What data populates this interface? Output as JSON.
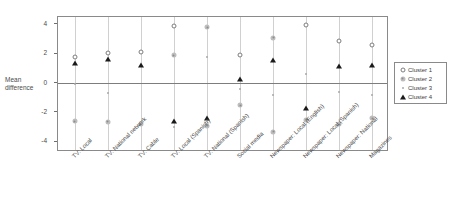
{
  "chart_data": {
    "type": "scatter",
    "title": "",
    "xlabel": "",
    "ylabel": "Mean difference",
    "ylim": [
      -4.7,
      4.5
    ],
    "yticks": [
      4,
      2,
      0,
      -2,
      -4
    ],
    "ytick_labels": [
      "4",
      "2",
      "0",
      "-2",
      "-4"
    ],
    "grid": "vertical category lines, horizontal reference line at 0",
    "legend_position": "right outside",
    "categories": [
      "TV: Local",
      "TV: National network",
      "TV: Cable",
      "TV: Local (Spanish)",
      "TV: National (Spanish)",
      "Social media",
      "Newspaper: Local (English)",
      "Newspaper: Local (Spanish)",
      "Newspaper: National",
      "Magazines"
    ],
    "series": [
      {
        "name": "Cluster 1",
        "marker": "open-circle",
        "color": "#7c7c7c",
        "values": [
          1.8,
          2.05,
          2.15,
          3.9,
          null,
          1.9,
          null,
          3.95,
          2.9,
          2.6
        ]
      },
      {
        "name": "Cluster 2",
        "marker": "gray-circle-dot",
        "color": "#bdbdbd",
        "values": [
          -2.6,
          -2.65,
          -2.8,
          1.9,
          3.8,
          -1.5,
          3.1,
          -2.5,
          -2.8,
          -2.4
        ]
      },
      {
        "name": "Cluster 3",
        "marker": "small-dot",
        "color": "#a8a8a8",
        "values": [
          -0.05,
          -0.65,
          null,
          -3.0,
          1.8,
          -0.4,
          -0.8,
          0.6,
          -0.6,
          -0.8
        ]
      },
      {
        "name": "Cluster 4",
        "marker": "filled-triangle",
        "color": "#1a1a1a",
        "values": [
          1.4,
          1.65,
          1.2,
          -2.55,
          -2.35,
          0.3,
          1.6,
          -1.7,
          1.15,
          1.2
        ]
      }
    ],
    "extra_points": [
      {
        "series": "Cluster 2",
        "category": "Newspaper: Local (English)",
        "value": -3.3
      },
      {
        "series": "Cluster 2",
        "category": "TV: National (Spanish)",
        "value": -2.9
      }
    ],
    "reference_line": 0
  },
  "legend": {
    "items": [
      {
        "label": "Cluster 1"
      },
      {
        "label": "Cluster 2"
      },
      {
        "label": "Cluster 3"
      },
      {
        "label": "Cluster 4"
      }
    ]
  },
  "axis": {
    "y_title_line1": "Mean",
    "y_title_line2": "difference"
  }
}
